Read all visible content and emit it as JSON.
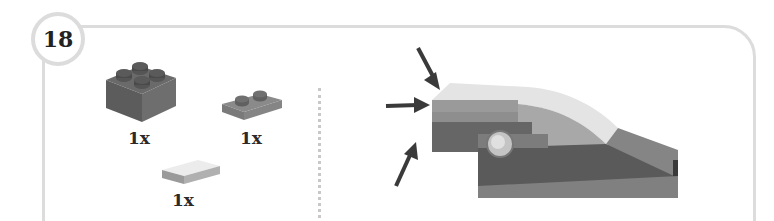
{
  "step": {
    "number": "18"
  },
  "parts_list": {
    "items": [
      {
        "name": "brick-2x2",
        "color": "dark-gray",
        "quantity": "1x"
      },
      {
        "name": "plate-1x2",
        "color": "medium-gray",
        "quantity": "1x"
      },
      {
        "name": "tile-1x2",
        "color": "light-gray",
        "quantity": "1x"
      }
    ]
  },
  "assembly": {
    "arrows": 3,
    "description": "Attach parts to the rear face of the model"
  }
}
